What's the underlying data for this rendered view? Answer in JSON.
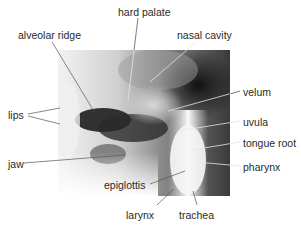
{
  "figure": {
    "labels": [
      {
        "id": "hard-palate",
        "text": "hard palate",
        "x": 118,
        "y": 6
      },
      {
        "id": "alveolar-ridge",
        "text": "alveolar ridge",
        "x": 18,
        "y": 29
      },
      {
        "id": "nasal-cavity",
        "text": "nasal cavity",
        "x": 177,
        "y": 29
      },
      {
        "id": "velum",
        "text": "velum",
        "x": 243,
        "y": 86
      },
      {
        "id": "lips",
        "text": "lips",
        "x": 8,
        "y": 109
      },
      {
        "id": "uvula",
        "text": "uvula",
        "x": 243,
        "y": 116
      },
      {
        "id": "tongue-root",
        "text": "tongue root",
        "x": 243,
        "y": 137
      },
      {
        "id": "jaw",
        "text": "jaw",
        "x": 8,
        "y": 158
      },
      {
        "id": "pharynx",
        "text": "pharynx",
        "x": 243,
        "y": 163
      },
      {
        "id": "epiglottis",
        "text": "epiglottis",
        "x": 104,
        "y": 180
      },
      {
        "id": "larynx",
        "text": "larynx",
        "x": 126,
        "y": 209
      },
      {
        "id": "trachea",
        "text": "trachea",
        "x": 179,
        "y": 209
      }
    ],
    "colors": {
      "label_text": "#2a2a2a",
      "leader_line": "#e8e8e8",
      "leader_line_outside": "#555555"
    }
  }
}
